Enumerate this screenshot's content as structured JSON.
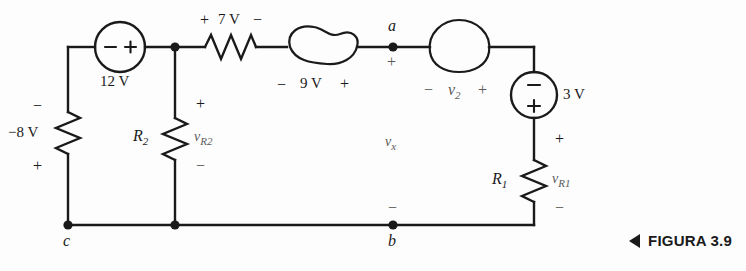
{
  "figure": {
    "caption": "FIGURA 3.9",
    "caption_marker": "triangle-left"
  },
  "circuit": {
    "sources": [
      {
        "id": "v12",
        "label": "12 V",
        "type": "voltage-source-circle",
        "orientation": "horizontal",
        "plus": "+",
        "minus": "−"
      },
      {
        "id": "v3",
        "label": "3 V",
        "type": "voltage-source-circle",
        "orientation": "vertical",
        "plus": "+",
        "minus": "−"
      }
    ],
    "resistors": [
      {
        "id": "r7",
        "label": "7 V",
        "orientation": "horizontal",
        "plus": "+",
        "minus": "−"
      },
      {
        "id": "rneg8",
        "label": "−8 V",
        "orientation": "vertical",
        "plus": "+",
        "minus": "−"
      },
      {
        "id": "r2",
        "symbol": "R",
        "sub": "2",
        "v_symbol": "v",
        "v_sub": "R2",
        "plus": "+",
        "minus": "−"
      },
      {
        "id": "r1",
        "symbol": "R",
        "sub": "1",
        "v_symbol": "v",
        "v_sub": "R1",
        "plus": "+",
        "minus": "−"
      }
    ],
    "blobs": [
      {
        "id": "blob9",
        "shape": "bean",
        "label": "9 V",
        "plus": "+",
        "minus": "−"
      },
      {
        "id": "blob2",
        "shape": "dome",
        "v_symbol": "v",
        "v_sub": "2",
        "plus": "+",
        "minus": "−"
      }
    ],
    "nodes": [
      {
        "id": "a",
        "label": "a",
        "polarity": "+"
      },
      {
        "id": "b",
        "label": "b",
        "polarity": "−"
      },
      {
        "id": "c",
        "label": "c",
        "polarity": ""
      }
    ],
    "mesh_voltage": {
      "v_symbol": "v",
      "v_sub": "x"
    },
    "colors": {
      "wire": "#1a1a1a",
      "background": "#fdfdfd",
      "text": "#1a1a1a",
      "faint_text": "#5a5a5a"
    }
  }
}
